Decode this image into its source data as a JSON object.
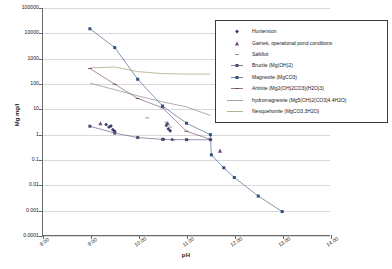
{
  "chart_data": {
    "type": "scatter",
    "title": "",
    "xlabel": "pH",
    "ylabel": "Mg  mg/l",
    "xlim": [
      8.0,
      14.0
    ],
    "ylim": [
      0.0001,
      100000
    ],
    "yscale": "log",
    "grid": true,
    "legend_position": "top-right",
    "xticks": [
      "8.00",
      "9.00",
      "10.00",
      "11.00",
      "12.00",
      "13.00",
      "14.00"
    ],
    "yticks": [
      "100000",
      "10000",
      "1000",
      "100",
      "10",
      "1",
      "0.1",
      "0.01",
      "0.001",
      "0.0001"
    ],
    "series": [
      {
        "name": "Hunterston",
        "marker": "diamond",
        "line": "none",
        "color": "#3b3b6e",
        "points": [
          {
            "x": 9.32,
            "y": 2.4
          },
          {
            "x": 9.38,
            "y": 1.9
          },
          {
            "x": 9.42,
            "y": 2.1
          },
          {
            "x": 9.46,
            "y": 1.5
          },
          {
            "x": 9.5,
            "y": 1.3
          },
          {
            "x": 10.52,
            "y": 0.62
          },
          {
            "x": 10.58,
            "y": 2.2
          },
          {
            "x": 10.6,
            "y": 2.6
          },
          {
            "x": 10.62,
            "y": 1.6
          },
          {
            "x": 10.66,
            "y": 1.35
          },
          {
            "x": 10.7,
            "y": 0.6
          }
        ]
      },
      {
        "name": "Garnek, operational pond conditions",
        "marker": "triangle",
        "line": "none",
        "color": "#6d4b7a",
        "points": [
          {
            "x": 9.2,
            "y": 2.7
          },
          {
            "x": 11.7,
            "y": 0.22
          }
        ]
      },
      {
        "name": "Salkfiot",
        "marker": "dash",
        "line": "none",
        "color": "#8a8a8a",
        "points": [
          {
            "x": 10.18,
            "y": 4.4
          },
          {
            "x": 10.58,
            "y": 3.0
          },
          {
            "x": 10.62,
            "y": 2.3
          },
          {
            "x": 10.66,
            "y": 1.9
          },
          {
            "x": 10.72,
            "y": 0.58
          },
          {
            "x": 11.02,
            "y": 0.6
          }
        ]
      },
      {
        "name": "Brucite (Mg(OH)2)",
        "marker": "square",
        "line": "solid",
        "color": "#4a4a72",
        "points": [
          {
            "x": 8.98,
            "y": 2.05
          },
          {
            "x": 9.5,
            "y": 1.1
          },
          {
            "x": 9.98,
            "y": 0.73
          },
          {
            "x": 10.5,
            "y": 0.62
          },
          {
            "x": 11.0,
            "y": 0.6
          },
          {
            "x": 11.5,
            "y": 0.6
          }
        ]
      },
      {
        "name": "Magnesite (MgCO3)",
        "marker": "square",
        "line": "solid",
        "color": "#2f4f7f",
        "points": [
          {
            "x": 8.98,
            "y": 15000
          },
          {
            "x": 9.5,
            "y": 2700
          },
          {
            "x": 9.98,
            "y": 150
          },
          {
            "x": 10.5,
            "y": 13
          },
          {
            "x": 11.0,
            "y": 2.7
          },
          {
            "x": 11.5,
            "y": 0.95
          },
          {
            "x": 11.52,
            "y": 0.15
          },
          {
            "x": 11.78,
            "y": 0.046
          },
          {
            "x": 12.0,
            "y": 0.019
          },
          {
            "x": 12.5,
            "y": 0.0035
          },
          {
            "x": 13.0,
            "y": 0.00085
          }
        ]
      },
      {
        "name": "Artinite (Mg2(OH)2CO3)(H2O)3)",
        "marker": "dash",
        "line": "solid",
        "color": "#6b3f6b",
        "points": [
          {
            "x": 8.98,
            "y": 400
          },
          {
            "x": 9.5,
            "y": 95
          },
          {
            "x": 9.98,
            "y": 26
          },
          {
            "x": 10.5,
            "y": 11
          },
          {
            "x": 11.0,
            "y": 1.3
          },
          {
            "x": 11.5,
            "y": 0.62
          }
        ]
      },
      {
        "name": "hydromagnesite (Mg5(OH)2(CO3)4.4H2O)",
        "marker": "none",
        "line": "solid",
        "color": "#7a7a7a",
        "points": [
          {
            "x": 8.98,
            "y": 105
          },
          {
            "x": 9.98,
            "y": 33
          },
          {
            "x": 10.5,
            "y": 19
          },
          {
            "x": 11.0,
            "y": 12
          },
          {
            "x": 11.5,
            "y": 5.5
          }
        ]
      },
      {
        "name": "Nesquehonite (MgCO3.3H2O)",
        "marker": "none",
        "line": "solid",
        "color": "#9a8a6a",
        "points": [
          {
            "x": 8.98,
            "y": 420
          },
          {
            "x": 9.5,
            "y": 460
          },
          {
            "x": 9.98,
            "y": 300
          },
          {
            "x": 10.5,
            "y": 250
          },
          {
            "x": 11.0,
            "y": 240
          },
          {
            "x": 11.5,
            "y": 240
          }
        ]
      }
    ]
  }
}
